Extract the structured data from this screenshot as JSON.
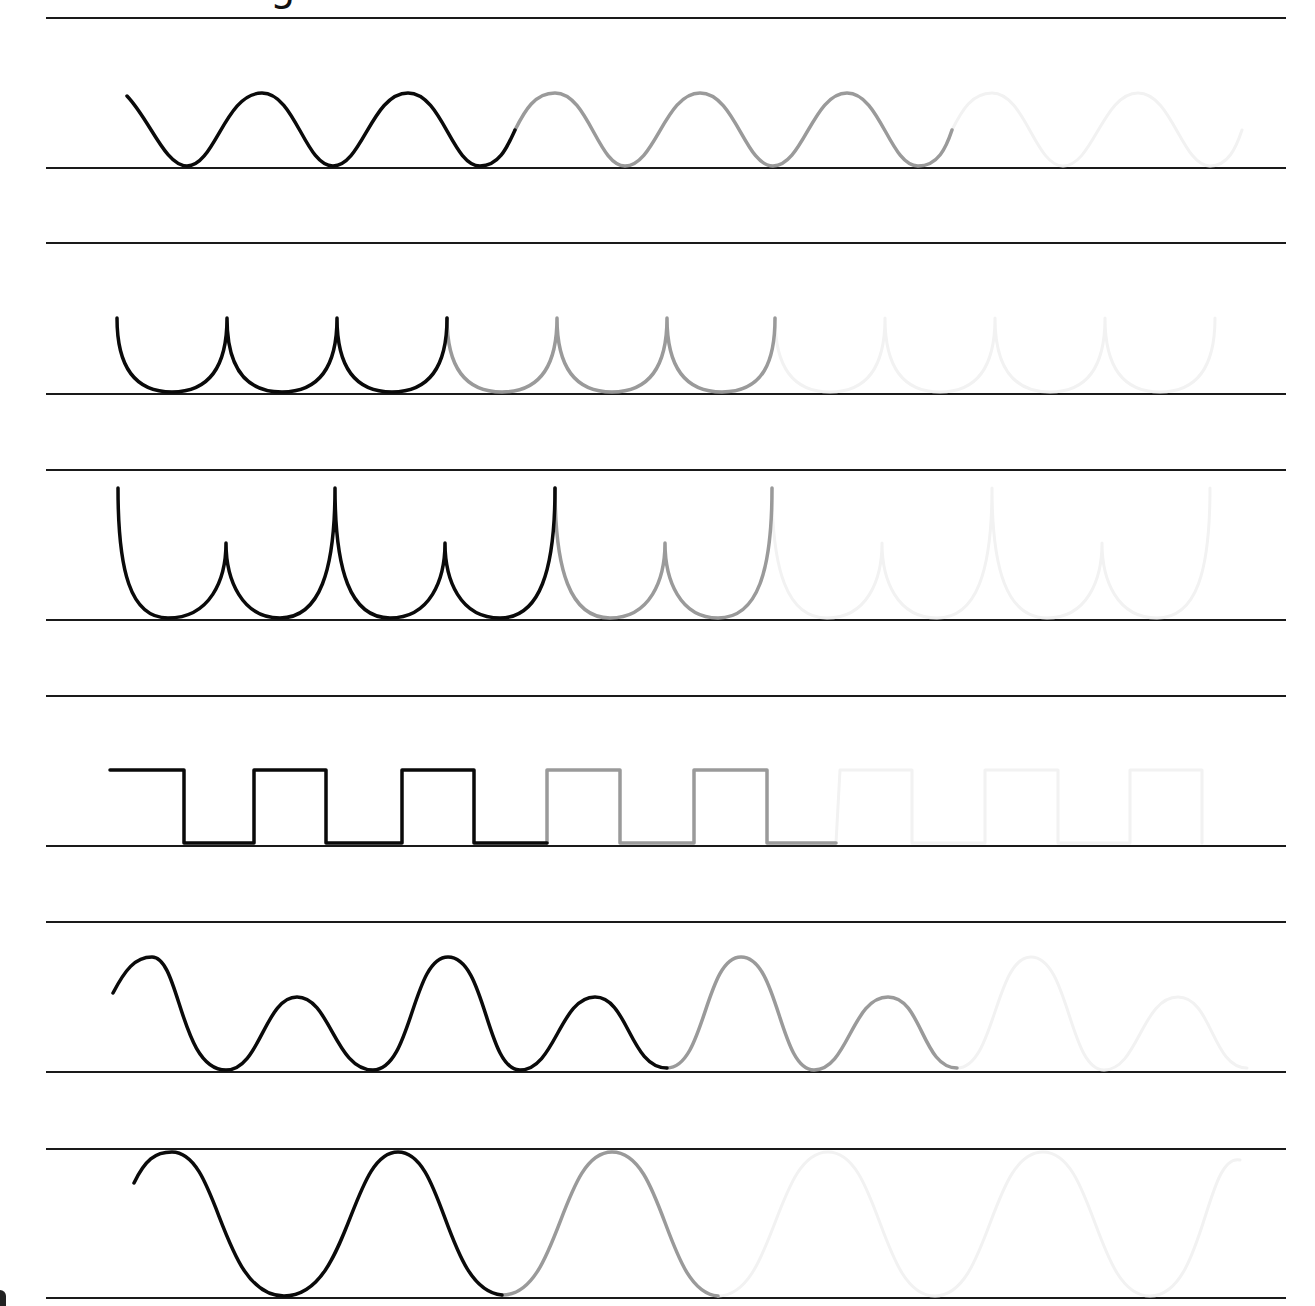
{
  "worksheet": {
    "title_fragment": "g",
    "type": "pre-writing tracing practice",
    "colors": {
      "guide_line": "#1a1a1a",
      "trace_solid": "#0a0a0a",
      "trace_dotted_gray": "#9a9a9a",
      "trace_ghost": "#f2f2f2",
      "background": "#ffffff"
    },
    "guide_lines_y": [
      18,
      168,
      243,
      394,
      470,
      620,
      696,
      846,
      922,
      1072,
      1149,
      1298
    ],
    "rows": [
      {
        "id": "row-1",
        "pattern": "rolling wave",
        "dark_path": "M127,96 C150,120 165,166 187,166 C215,166 225,93 262,93 C295,93 305,166 333,166 C362,166 372,93 408,93 C442,93 452,166 480,166 C500,166 508,145 515,130",
        "gray_path": "M515,130 C525,110 535,93 555,93 C588,93 598,166 625,166 C655,166 665,93 700,93 C735,93 745,166 773,166 C803,166 813,93 847,93 C880,93 890,166 918,166 C938,166 946,148 952,130",
        "ghost_path": "M952,130 C962,110 972,93 992,93 C1025,93 1035,166 1063,166 C1093,166 1103,93 1138,93 C1172,93 1182,166 1210,166 C1228,166 1236,148 1242,130"
      },
      {
        "id": "row-2",
        "pattern": "cupped loops",
        "dark_path": "M117,318 C117,360 130,392 172,392 C214,392 227,360 227,318 C227,360 240,392 282,392 C324,392 337,360 337,318 C337,360 350,392 392,392 C434,392 447,360 447,318",
        "gray_path": "M447,318 C447,360 460,392 502,392 C544,392 557,360 557,318 C557,360 570,392 612,392 C654,392 667,360 667,318 C667,360 680,392 722,392 C764,392 775,360 775,318",
        "ghost_path": "M775,318 C775,360 788,392 830,392 C872,392 885,360 885,318 C885,360 898,392 940,392 C982,392 995,360 995,318 C995,360 1008,392 1050,392 C1092,392 1105,360 1105,318 C1105,360 1118,392 1160,392 C1202,392 1215,360 1215,318"
      },
      {
        "id": "row-3",
        "pattern": "alternating tall/short cups",
        "dark_path": "M118,488 C118,570 130,618 168,618 C210,618 226,580 226,543 C226,580 242,618 280,618 C320,618 335,570 335,488 C335,570 350,618 390,618 C430,618 445,580 445,543 C445,580 460,618 500,618 C540,618 555,570 555,488",
        "gray_path": "M555,488 C555,570 570,618 610,618 C650,618 665,580 665,543 C665,580 680,618 718,618 C758,618 772,570 772,488",
        "ghost_path": "M772,488 C772,570 787,618 827,618 C867,618 882,580 882,543 C882,580 897,618 937,618 C977,618 992,570 992,488 C992,570 1007,618 1047,618 C1087,618 1102,580 1102,543 C1102,580 1117,618 1157,618 C1197,618 1210,570 1210,488"
      },
      {
        "id": "row-4",
        "pattern": "square wave",
        "dark_path": "M110,770 L184,770 L184,843 L254,843 L254,770 L326,770 L326,843 L402,843 L402,770 L474,770 L474,843 L547,843",
        "gray_path": "M547,843 L547,770 L620,770 L620,843 L694,843 L694,770 L767,770 L767,843 L836,843",
        "ghost_path": "M836,843 L840,770 L912,770 L912,843 L985,843 L985,770 L1058,770 L1058,843 L1130,843 L1130,770 L1202,770 L1202,843"
      },
      {
        "id": "row-5",
        "pattern": "big/small hills",
        "dark_path": "M113,993 C125,970 135,957 152,957 C180,957 180,1070 226,1070 C260,1070 265,997 297,997 C330,997 335,1070 373,1070 C412,1070 412,957 448,957 C486,957 486,1070 520,1070 C555,1070 560,997 595,997 C628,997 630,1068 667,1068",
        "gray_path": "M667,1068 C705,1068 705,957 741,957 C779,957 779,1070 814,1070 C848,1070 852,997 888,997 C922,997 922,1068 957,1068",
        "ghost_path": "M957,1068 C995,1068 995,957 1031,957 C1069,957 1069,1070 1104,1070 C1138,1070 1142,997 1178,997 C1212,997 1212,1068 1247,1068"
      },
      {
        "id": "row-6",
        "pattern": "tall rounded waves",
        "dark_path": "M134,1183 C145,1160 155,1152 172,1152 C220,1152 220,1296 284,1296 C350,1296 350,1152 398,1152 C445,1152 445,1290 502,1295",
        "gray_path": "M502,1295 C560,1296 560,1152 612,1152 C665,1152 665,1292 718,1296",
        "ghost_path": "M718,1296 C775,1296 775,1152 828,1152 C880,1152 880,1296 935,1296 C990,1296 990,1152 1043,1152 C1095,1152 1095,1296 1150,1296 C1205,1296 1205,1152 1240,1160"
      }
    ]
  }
}
